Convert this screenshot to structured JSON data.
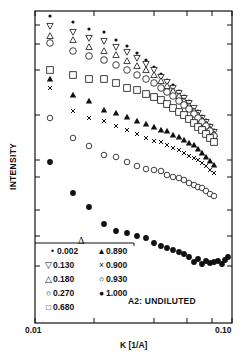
{
  "chart_data": {
    "type": "scatter",
    "title": "",
    "annotation": "A2:  UNDILUTED",
    "xlabel": "K  [1/A]",
    "ylabel": "INTENSITY",
    "xscale": "log",
    "yscale": "log",
    "xlim": [
      0.01,
      0.1
    ],
    "xticklabels": [
      "0.01",
      "0.10"
    ],
    "yticklabels": [],
    "y_units": "relative log intensity (arbitrary, 0 = bottom axis, 1 unit = 1 px of frame height)",
    "legend_title": "Δ",
    "legend_position": "lower left",
    "grid": false,
    "frame_px": {
      "left": 35,
      "right": 232,
      "top": 11,
      "bottom": 323
    },
    "x_ticks_px": [
      35,
      94,
      154,
      187,
      212,
      232
    ],
    "y_ticks_left_px": [
      25,
      44,
      70,
      115,
      160,
      177,
      210,
      236,
      266
    ],
    "y_ticks_right_px": [
      25,
      44,
      70,
      115,
      160,
      177,
      210,
      236,
      266
    ],
    "series": [
      {
        "name": "0.002",
        "marker": "small-dot",
        "x_px": [
          50,
          73,
          89,
          104,
          116,
          127,
          137,
          146,
          154,
          161,
          167,
          173,
          179,
          184,
          189,
          194,
          198,
          202,
          206,
          210,
          214
        ],
        "y_px": [
          16,
          22,
          29,
          32,
          40,
          46,
          53,
          60,
          67,
          74,
          80,
          85,
          91,
          96,
          101,
          107,
          111,
          116,
          120,
          125,
          130
        ]
      },
      {
        "name": "0.130",
        "marker": "triangle-down-open",
        "x_px": [
          50,
          73,
          89,
          104,
          116,
          127,
          137,
          146,
          154,
          161,
          167,
          173,
          179,
          184,
          189,
          194,
          198,
          202,
          206,
          210,
          214
        ],
        "y_px": [
          26,
          32,
          38,
          41,
          47,
          52,
          58,
          64,
          70,
          77,
          82,
          88,
          93,
          98,
          103,
          108,
          113,
          118,
          122,
          127,
          132
        ]
      },
      {
        "name": "0.180",
        "marker": "triangle-up-open",
        "x_px": [
          50,
          73,
          89,
          104,
          116,
          127,
          137,
          146,
          154,
          161,
          167,
          173,
          179,
          184,
          189,
          194,
          198,
          202,
          206,
          210,
          214
        ],
        "y_px": [
          36,
          40,
          47,
          51,
          55,
          61,
          66,
          70,
          75,
          81,
          86,
          91,
          96,
          101,
          106,
          111,
          115,
          120,
          124,
          129,
          134
        ]
      },
      {
        "name": "0.270",
        "marker": "circle-open",
        "x_px": [
          50,
          73,
          89,
          104,
          116,
          127,
          137,
          146,
          154,
          161,
          167,
          173,
          179,
          184,
          189,
          194,
          198,
          202,
          206,
          210,
          214
        ],
        "y_px": [
          43,
          51,
          56,
          60,
          65,
          70,
          75,
          79,
          83,
          88,
          92,
          96,
          101,
          105,
          109,
          114,
          118,
          122,
          126,
          131,
          136
        ]
      },
      {
        "name": "0.680",
        "marker": "square-open",
        "x_px": [
          50,
          73,
          89,
          104,
          116,
          127,
          137,
          146,
          154,
          161,
          167,
          173,
          179,
          184,
          189,
          194,
          198,
          202,
          206,
          210,
          214
        ],
        "y_px": [
          70,
          75,
          79,
          79,
          83,
          88,
          90,
          94,
          97,
          100,
          104,
          108,
          112,
          115,
          119,
          123,
          127,
          130,
          134,
          138,
          142
        ]
      },
      {
        "name": "0.890",
        "marker": "triangle-up-filled",
        "x_px": [
          50,
          73,
          89,
          104,
          116,
          127,
          137,
          146,
          154,
          161,
          167,
          173,
          179,
          184,
          189,
          194,
          198,
          202,
          206,
          210,
          214
        ],
        "y_px": [
          79,
          95,
          101,
          110,
          113,
          117,
          121,
          124,
          127,
          130,
          131,
          135,
          137,
          140,
          143,
          145,
          149,
          153,
          157,
          161,
          165
        ]
      },
      {
        "name": "0.900",
        "marker": "cross",
        "x_px": [
          50,
          73,
          89,
          104,
          116,
          127,
          137,
          146,
          154,
          161,
          167,
          173,
          179,
          184,
          189,
          194,
          198,
          202,
          206,
          210,
          214
        ],
        "y_px": [
          88,
          111,
          118,
          121,
          126,
          130,
          134,
          138,
          141,
          142,
          145,
          148,
          150,
          153,
          156,
          158,
          160,
          163,
          166,
          170,
          173
        ]
      },
      {
        "name": "0.930",
        "marker": "circle-open-small",
        "x_px": [
          50,
          73,
          89,
          104,
          116,
          127,
          137,
          146,
          154,
          161,
          167,
          173,
          179,
          184,
          189,
          194,
          198,
          202,
          206,
          210,
          214
        ],
        "y_px": [
          118,
          138,
          146,
          155,
          157,
          162,
          166,
          169,
          170,
          171,
          175,
          177,
          178,
          180,
          183,
          185,
          187,
          188,
          191,
          194,
          196
        ]
      },
      {
        "name": "1.000",
        "marker": "octagon-filled",
        "x_px": [
          50,
          73,
          89,
          104,
          116,
          127,
          137,
          146,
          154,
          161,
          167,
          173,
          179,
          184,
          189,
          194,
          198,
          202,
          206,
          210,
          214,
          218,
          222,
          225,
          228
        ],
        "y_px": [
          162,
          193,
          207,
          224,
          231,
          233,
          236,
          238,
          243,
          246,
          248,
          250,
          252,
          254,
          257,
          262,
          259,
          264,
          261,
          263,
          262,
          261,
          264,
          260,
          257
        ]
      }
    ]
  },
  "legend": {
    "title": "Δ",
    "items": [
      {
        "symbol": "•",
        "label": "0.002"
      },
      {
        "symbol": "▲",
        "label": "0.890"
      },
      {
        "symbol": "▽",
        "label": "0.130"
      },
      {
        "symbol": "×",
        "label": "0.900"
      },
      {
        "symbol": "△",
        "label": "0.180"
      },
      {
        "symbol": "○",
        "label": "0.930"
      },
      {
        "symbol": "○",
        "label": "0.270"
      },
      {
        "symbol": "●",
        "label": "1.000"
      },
      {
        "symbol": "□",
        "label": "0.680"
      }
    ]
  },
  "labels": {
    "ylabel": "INTENSITY",
    "xlabel": "K  [1/A]",
    "xtick_min": "0.01",
    "xtick_max": "0.10",
    "annotation": "A2:  UNDILUTED",
    "legend_title": "Δ"
  },
  "colors": {
    "ink": "#111111",
    "background": "#ffffff"
  }
}
